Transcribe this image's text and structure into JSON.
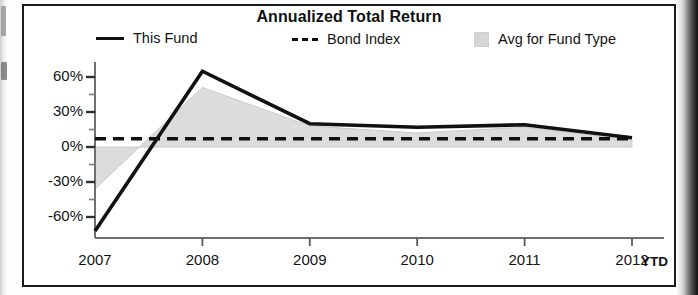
{
  "chart": {
    "title": "Annualized Total Return",
    "ytd_note": "YTD"
  },
  "legend": {
    "items": [
      {
        "label": "This Fund",
        "swatch": "solid-line-swatch",
        "color": "#111111"
      },
      {
        "label": "Bond Index",
        "swatch": "dashed-line-swatch",
        "color": "#111111"
      },
      {
        "label": "Avg for Fund Type",
        "swatch": "gray-square-swatch",
        "color": "#d6d6d6"
      }
    ]
  },
  "axes": {
    "y_ticks": [
      "60%",
      "30%",
      "0%",
      "-30%",
      "-60%"
    ],
    "x_ticks": [
      "2007",
      "2008",
      "2009",
      "2010",
      "2011",
      "2012"
    ]
  },
  "chart_data": {
    "type": "line",
    "title": "Annualized Total Return",
    "xlabel": "",
    "ylabel": "",
    "categories": [
      "2007",
      "2008",
      "2009",
      "2010",
      "2011",
      "2012"
    ],
    "x_tick_labels": [
      "2007",
      "2008",
      "2009",
      "2010",
      "2011",
      "2012"
    ],
    "y_tick_labels": [
      "60%",
      "30%",
      "0%",
      "-30%",
      "-60%"
    ],
    "y_tick_values": [
      60,
      30,
      0,
      -30,
      -60
    ],
    "ylim": [
      -75,
      70
    ],
    "grid": false,
    "legend_position": "top",
    "annotations": [
      "YTD"
    ],
    "series": [
      {
        "name": "This Fund",
        "style": "solid",
        "color": "#111111",
        "values": [
          -72,
          65,
          20,
          17,
          19,
          8
        ]
      },
      {
        "name": "Bond Index",
        "style": "dashed",
        "color": "#111111",
        "values": [
          7,
          7,
          7,
          7,
          7,
          7
        ]
      },
      {
        "name": "Avg for Fund Type",
        "style": "filled-area",
        "color": "#d6d6d6",
        "values": [
          -36,
          51,
          18,
          12,
          17,
          6
        ]
      }
    ]
  }
}
